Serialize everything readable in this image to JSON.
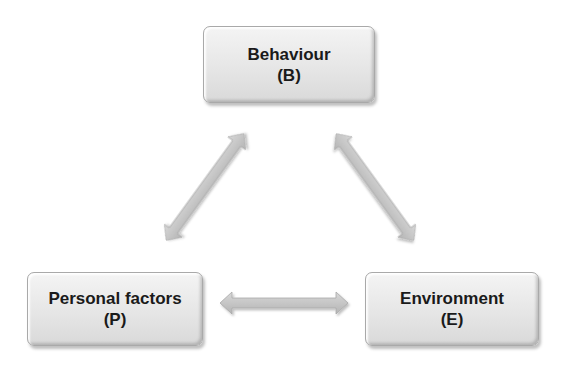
{
  "diagram": {
    "type": "triadic-reciprocal-model",
    "nodes": [
      {
        "id": "B",
        "label": "Behaviour",
        "abbr": "(B)"
      },
      {
        "id": "P",
        "label": "Personal factors",
        "abbr": "(P)"
      },
      {
        "id": "E",
        "label": "Environment",
        "abbr": "(E)"
      }
    ],
    "edges": [
      {
        "from": "B",
        "to": "P",
        "direction": "bidirectional"
      },
      {
        "from": "B",
        "to": "E",
        "direction": "bidirectional"
      },
      {
        "from": "P",
        "to": "E",
        "direction": "bidirectional"
      }
    ],
    "colors": {
      "node_fill": "#e6e6e6",
      "node_border": "#a9a9a9",
      "arrow_fill": "#c8c8c8",
      "text": "#1a1a1a"
    }
  }
}
